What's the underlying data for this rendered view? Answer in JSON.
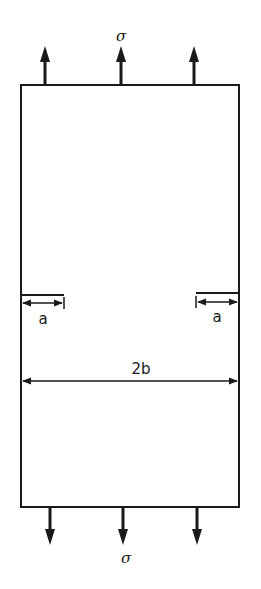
{
  "diagram": {
    "stress_top_label": "σ",
    "stress_bottom_label": "σ",
    "crack_left_label": "a",
    "crack_right_label": "a",
    "width_label": "2b",
    "colors": {
      "line": "#1a1a1a",
      "background": "#ffffff"
    },
    "arrows_top_count": 3,
    "arrows_bottom_count": 3
  }
}
